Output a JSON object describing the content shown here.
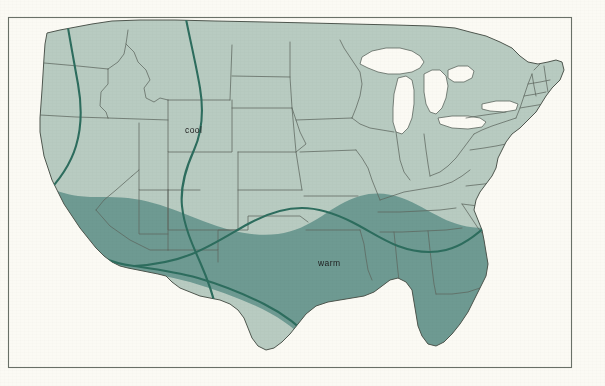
{
  "figure": {
    "kind": "thematic-map",
    "region": "Contiguous United States",
    "paper_color": "#fbfaf4",
    "frame_color": "#575f55",
    "frame": {
      "x": 8,
      "y": 17,
      "width": 564,
      "height": 351
    }
  },
  "legend_labels": {
    "cool": "cool",
    "warm": "warm"
  },
  "label_positions": {
    "cool": {
      "x": 185,
      "y": 133
    },
    "warm": {
      "x": 318,
      "y": 266
    }
  },
  "colors": {
    "cool_zone": "#b8cbc1",
    "warm_zone": "#6e9a92",
    "state_border": "#5d675f",
    "coastline": "#4e564e",
    "isoline": "#2d6d5e",
    "water": "#fbfaf4",
    "label_text": "#1d1d1d"
  },
  "chart_data": {
    "type": "map",
    "title": "",
    "zones": [
      {
        "name": "cool",
        "label": "cool",
        "color": "#b8cbc1",
        "description": "Northern and interior United States including the Pacific Northwest, Northern Rockies, Great Plains, Midwest, Great Lakes states, Mid-Atlantic and New England"
      },
      {
        "name": "warm",
        "label": "warm",
        "color": "#6e9a92",
        "description": "Southern United States including coastal and southern California, the desert Southwest, Texas, the Gulf Coast, the Southeast and Florida"
      }
    ],
    "isolines": [
      {
        "name": "western-isoline",
        "orientation": "north-south",
        "through": "Pacific Northwest to Southern California"
      },
      {
        "name": "plains-isoline",
        "orientation": "north-south",
        "through": "Northern Plains to Texas"
      },
      {
        "name": "warm-cool-boundary",
        "orientation": "east-west",
        "through": "Southern California across the Southwest, Texas, the Gulf states and up the Atlantic seaboard"
      }
    ],
    "legend_position": "in-map annotations",
    "grid": false
  }
}
